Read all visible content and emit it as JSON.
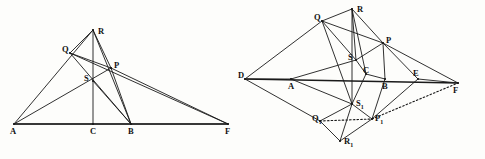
{
  "figure": {
    "background_color": "#fdfdfb",
    "stroke_color": "#1a1a1a",
    "panels": [
      {
        "id": "left-panel",
        "name": "left-triangle-diagram",
        "description": "Triangle ARB with cevians, baseline A-C-B-F",
        "vertices": [
          {
            "key": "A",
            "label": "A",
            "x": 14,
            "y": 124,
            "label_x": 10,
            "label_y": 127
          },
          {
            "key": "C",
            "label": "C",
            "x": 93,
            "y": 124,
            "label_x": 90,
            "label_y": 127
          },
          {
            "key": "B",
            "label": "B",
            "x": 131,
            "y": 124,
            "label_x": 128,
            "label_y": 127
          },
          {
            "key": "F",
            "label": "F",
            "x": 228,
            "y": 124,
            "label_x": 225,
            "label_y": 127
          },
          {
            "key": "R",
            "label": "R",
            "x": 93,
            "y": 30,
            "label_x": 98,
            "label_y": 27
          },
          {
            "key": "Q",
            "label": "Q",
            "x": 70,
            "y": 53,
            "label_x": 62,
            "label_y": 45
          },
          {
            "key": "P",
            "label": "P",
            "x": 111,
            "y": 68,
            "label_x": 114,
            "label_y": 61
          },
          {
            "key": "S",
            "label": "S",
            "x": 93,
            "y": 81,
            "label_x": 84,
            "label_y": 74
          }
        ],
        "baseline": {
          "from": "A",
          "to": "F"
        },
        "segments": [
          {
            "from": "A",
            "to": "R"
          },
          {
            "from": "A",
            "to": "P"
          },
          {
            "from": "A",
            "to": "F"
          },
          {
            "from": "R",
            "to": "C"
          },
          {
            "from": "R",
            "to": "P"
          },
          {
            "from": "R",
            "to": "Q"
          },
          {
            "from": "R",
            "to": "B"
          },
          {
            "from": "Q",
            "to": "P"
          },
          {
            "from": "Q",
            "to": "B"
          },
          {
            "from": "Q",
            "to": "F"
          },
          {
            "from": "P",
            "to": "B"
          },
          {
            "from": "P",
            "to": "F"
          },
          {
            "from": "S",
            "to": "B"
          }
        ]
      },
      {
        "id": "right-panel",
        "name": "right-kite-diagram",
        "description": "Reflected construction with D-A-C-B-E-F baseline and mirrored points Q1 P1 R1 S1",
        "vertices": [
          {
            "key": "D",
            "label": "D",
            "x": 245,
            "y": 79,
            "label_x": 238,
            "label_y": 71
          },
          {
            "key": "A",
            "label": "A",
            "x": 291,
            "y": 79,
            "label_x": 288,
            "label_y": 82
          },
          {
            "key": "C",
            "label": "C",
            "x": 366,
            "y": 74,
            "label_x": 363,
            "label_y": 66
          },
          {
            "key": "B",
            "label": "B",
            "x": 385,
            "y": 79,
            "label_x": 382,
            "label_y": 82
          },
          {
            "key": "E",
            "label": "E",
            "x": 418,
            "y": 79,
            "label_x": 413,
            "label_y": 69
          },
          {
            "key": "F",
            "label": "F",
            "x": 458,
            "y": 83,
            "label_x": 453,
            "label_y": 86
          },
          {
            "key": "R",
            "label": "R",
            "x": 352,
            "y": 9,
            "label_x": 357,
            "label_y": 5
          },
          {
            "key": "Q",
            "label": "Q",
            "x": 322,
            "y": 21,
            "label_x": 314,
            "label_y": 13
          },
          {
            "key": "P",
            "label": "P",
            "x": 383,
            "y": 43,
            "label_x": 386,
            "label_y": 36
          },
          {
            "key": "S",
            "label": "S",
            "x": 356,
            "y": 60,
            "label_x": 348,
            "label_y": 53
          },
          {
            "key": "S1",
            "label": "S₁",
            "x": 352,
            "y": 104,
            "label_x": 356,
            "label_y": 99
          },
          {
            "key": "Q1",
            "label": "Q₁",
            "x": 320,
            "y": 121,
            "label_x": 312,
            "label_y": 114
          },
          {
            "key": "P1",
            "label": "P₁",
            "x": 372,
            "y": 119,
            "label_x": 375,
            "label_y": 114
          },
          {
            "key": "R1",
            "label": "R₁",
            "x": 340,
            "y": 141,
            "label_x": 344,
            "label_y": 137
          }
        ],
        "baseline": {
          "from": "D",
          "to": "F"
        },
        "segments": [
          {
            "from": "D",
            "to": "Q"
          },
          {
            "from": "D",
            "to": "A"
          },
          {
            "from": "D",
            "to": "Q1"
          },
          {
            "from": "Q",
            "to": "R"
          },
          {
            "from": "Q",
            "to": "P"
          },
          {
            "from": "Q",
            "to": "S"
          },
          {
            "from": "Q",
            "to": "S1"
          },
          {
            "from": "R",
            "to": "P"
          },
          {
            "from": "R",
            "to": "S"
          },
          {
            "from": "R",
            "to": "C"
          },
          {
            "from": "R",
            "to": "S1"
          },
          {
            "from": "P",
            "to": "E"
          },
          {
            "from": "P",
            "to": "F"
          },
          {
            "from": "P",
            "to": "B"
          },
          {
            "from": "P",
            "to": "S"
          },
          {
            "from": "A",
            "to": "S"
          },
          {
            "from": "A",
            "to": "S1"
          },
          {
            "from": "S",
            "to": "C"
          },
          {
            "from": "C",
            "to": "B"
          },
          {
            "from": "B",
            "to": "P1"
          },
          {
            "from": "E",
            "to": "P1"
          },
          {
            "from": "E",
            "to": "F"
          },
          {
            "from": "S1",
            "to": "P1"
          },
          {
            "from": "S1",
            "to": "R1"
          },
          {
            "from": "S1",
            "to": "Q1"
          },
          {
            "from": "Q1",
            "to": "R1"
          },
          {
            "from": "P1",
            "to": "R1"
          },
          {
            "from": "C",
            "to": "S1"
          }
        ],
        "dotted_segments": [
          {
            "from": "Q1",
            "to": "P1"
          },
          {
            "from": "P1",
            "to": "F"
          }
        ]
      }
    ]
  }
}
